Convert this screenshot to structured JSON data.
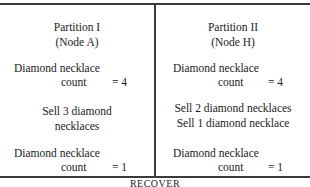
{
  "partitions": [
    {
      "title": "Partition I",
      "node": "(Node A)",
      "initial": {
        "label": "Diamond necklace",
        "word": "count",
        "eq": "= 4"
      },
      "actions": [
        "Sell 3 diamond",
        "necklaces"
      ],
      "final": {
        "label": "Diamond necklace",
        "word": "count",
        "eq": "= 1"
      }
    },
    {
      "title": "Partition II",
      "node": "(Node H)",
      "initial": {
        "label": "Diamond necklace",
        "word": "count",
        "eq": "= 4"
      },
      "actions": [
        "Sell 2 diamond necklaces",
        "Sell 1 diamond necklace"
      ],
      "final": {
        "label": "Diamond necklace",
        "word": "count",
        "eq": "= 1"
      }
    }
  ],
  "footer": "RECOVER"
}
